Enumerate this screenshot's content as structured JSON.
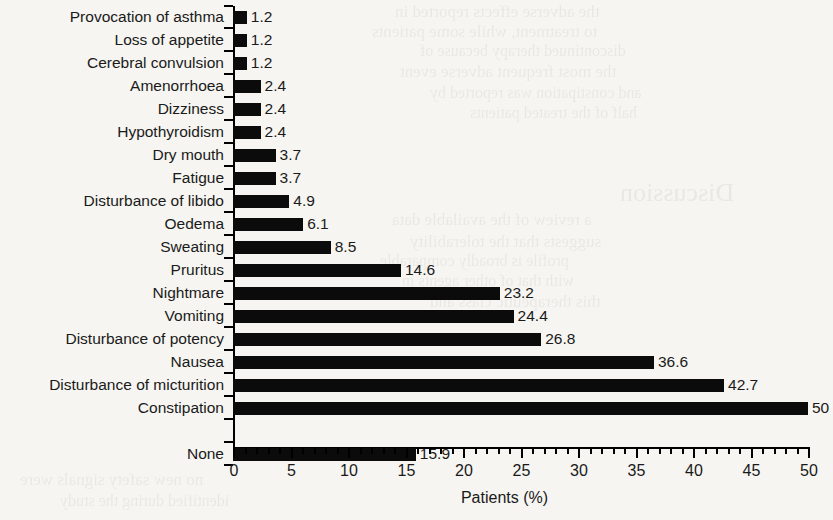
{
  "chart_data": {
    "type": "bar",
    "orientation": "horizontal",
    "title": "",
    "xlabel": "Patients (%)",
    "ylabel": "",
    "xlim": [
      0,
      50
    ],
    "xticks": [
      0,
      5,
      10,
      15,
      20,
      25,
      30,
      35,
      40,
      45,
      50
    ],
    "xtick_labels": [
      "0",
      "5",
      "10",
      "15",
      "20",
      "25",
      "30",
      "35",
      "40",
      "45",
      "50"
    ],
    "minor_tick_interval": 1,
    "grid": false,
    "legend": null,
    "bar_color": "#0b0b0b",
    "background_color": "#f6f5f1",
    "categories": [
      "Provocation of asthma",
      "Loss of appetite",
      "Cerebral convulsion",
      "Amenorrhoea",
      "Dizziness",
      "Hypothyroidism",
      "Dry mouth",
      "Fatigue",
      "Disturbance of libido",
      "Oedema",
      "Sweating",
      "Pruritus",
      "Nightmare",
      "Vomiting",
      "Disturbance of potency",
      "Nausea",
      "Disturbance of micturition",
      "Constipation",
      "",
      "None"
    ],
    "values": [
      1.2,
      1.2,
      1.2,
      2.4,
      2.4,
      2.4,
      3.7,
      3.7,
      4.9,
      6.1,
      8.5,
      14.6,
      23.2,
      24.4,
      26.8,
      36.6,
      42.7,
      50,
      null,
      15.9
    ],
    "value_labels": [
      "1.2",
      "1.2",
      "1.2",
      "2.4",
      "2.4",
      "2.4",
      "3.7",
      "3.7",
      "4.9",
      "6.1",
      "8.5",
      "14.6",
      "23.2",
      "24.4",
      "26.8",
      "36.6",
      "42.7",
      "50",
      "",
      "15.9"
    ]
  },
  "bleed_through": [
    "the adverse effects reported in",
    "to treatment, while some patients",
    "discontinued therapy because of",
    "the most frequent adverse event",
    "and constipation was reported by",
    "half of the treated patients",
    "Discussion",
    "a review of the available data",
    "suggests that the tolerability",
    "profile is broadly comparable",
    "with that of other agents in",
    "this therapeutic class and",
    "no new safety signals were",
    "identified during the study"
  ]
}
